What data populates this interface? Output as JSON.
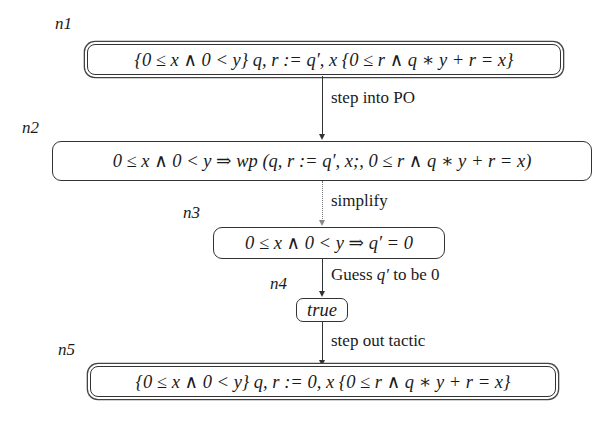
{
  "diagram": {
    "nodes": [
      {
        "id": "n1",
        "label": "n1",
        "text": "{0 ≤ x ∧ 0 < y} q, r := q′, x {0 ≤ r ∧ q ∗ y + r = x}",
        "style": "double-rounded"
      },
      {
        "id": "n2",
        "label": "n2",
        "text": "0 ≤ x ∧ 0 < y ⇒ wp (q, r := q′, x;, 0 ≤ r ∧ q ∗ y + r = x)",
        "style": "rounded"
      },
      {
        "id": "n3",
        "label": "n3",
        "text": "0 ≤ x ∧ 0 < y ⇒ q′ = 0",
        "style": "rounded"
      },
      {
        "id": "n4",
        "label": "n4",
        "text": "true",
        "style": "rounded"
      },
      {
        "id": "n5",
        "label": "n5",
        "text": "{0 ≤ x ∧ 0 < y} q, r := 0, x {0 ≤ r ∧ q ∗ y + r = x}",
        "style": "double-rounded"
      }
    ],
    "edges": [
      {
        "from": "n1",
        "to": "n2",
        "label": "step into PO",
        "style": "solid"
      },
      {
        "from": "n2",
        "to": "n3",
        "label": "simplify",
        "style": "dotted"
      },
      {
        "from": "n3",
        "to": "n4",
        "label_prefix": "Guess ",
        "label_math": "q′",
        "label_suffix": " to be 0",
        "style": "solid"
      },
      {
        "from": "n4",
        "to": "n5",
        "label": "step out tactic",
        "style": "solid"
      }
    ]
  }
}
